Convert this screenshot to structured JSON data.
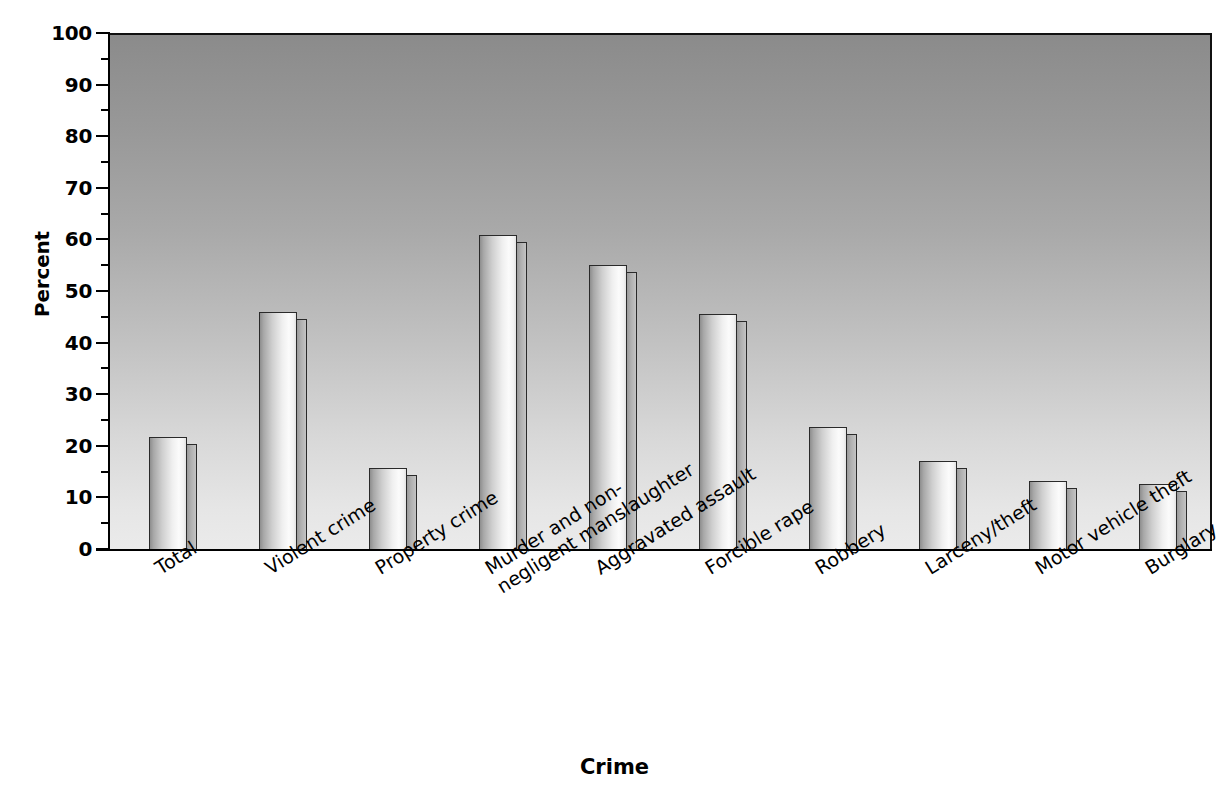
{
  "chart_data": {
    "type": "bar",
    "title": "",
    "xlabel": "Crime",
    "ylabel": "Percent",
    "ylim": [
      0,
      100
    ],
    "ytick_step": 10,
    "yminor_step": 5,
    "grid": false,
    "legend": "none",
    "categories": [
      "Total",
      "Violent crime",
      "Property crime",
      "Murder and non-negligent manslaughter",
      "Aggravated assault",
      "Forcible rape",
      "Robbery",
      "Larceny/theft",
      "Motor vehicle theft",
      "Burglary"
    ],
    "values": [
      22,
      46.3,
      16.1,
      61.3,
      55.4,
      46,
      24.1,
      17.4,
      13.6,
      12.9
    ],
    "ytick_labels": [
      "100",
      "90",
      "80",
      "70",
      "60",
      "50",
      "40",
      "30",
      "20",
      "10",
      "0"
    ],
    "ytick_values": [
      100,
      90,
      80,
      70,
      60,
      50,
      40,
      30,
      20,
      10,
      0
    ]
  },
  "axes": {
    "y_title": "Percent",
    "x_title": "Crime"
  },
  "x_tick_labels": [
    {
      "line1": "Total",
      "line2": ""
    },
    {
      "line1": "Violent crime",
      "line2": ""
    },
    {
      "line1": "Property crime",
      "line2": ""
    },
    {
      "line1": "Murder and non-",
      "line2": "negligent manslaughter"
    },
    {
      "line1": "Aggravated assault",
      "line2": ""
    },
    {
      "line1": "Forcible rape",
      "line2": ""
    },
    {
      "line1": "Robbery",
      "line2": ""
    },
    {
      "line1": "Larceny/theft",
      "line2": ""
    },
    {
      "line1": "Motor vehicle theft",
      "line2": ""
    },
    {
      "line1": "Burglary",
      "line2": ""
    }
  ],
  "colors": {
    "plot_bg_top": "#8b8b8b",
    "plot_bg_bottom": "#ebebeb",
    "bar_outline": "#2a2a2a",
    "bar_face_light": "#fbfbfb",
    "bar_face_dark": "#8e8e8e",
    "bar_side": "#b0b0b0",
    "axis": "#000000",
    "text": "#000000"
  }
}
